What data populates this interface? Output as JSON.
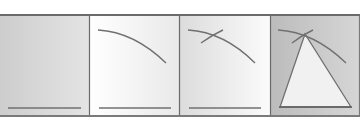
{
  "figure": {
    "panels": [
      {
        "step": 1,
        "content": "base segment",
        "background": [
          "#cfcfcf",
          "#e6e6e6"
        ]
      },
      {
        "step": 2,
        "content": "base segment with one arc",
        "background": [
          "#ffffff",
          "#e8e8e8"
        ]
      },
      {
        "step": 3,
        "content": "base segment with two intersecting arcs",
        "background": [
          "#e0e0e0",
          "#ffffff"
        ]
      },
      {
        "step": 4,
        "content": "equilateral triangle from arc intersection",
        "background": [
          "#bdbdbd",
          "#d8d8d8"
        ]
      }
    ],
    "colors": {
      "line": "#707070",
      "border": "#6a6a6a",
      "triangle_fill": "#f1f1f1"
    }
  }
}
